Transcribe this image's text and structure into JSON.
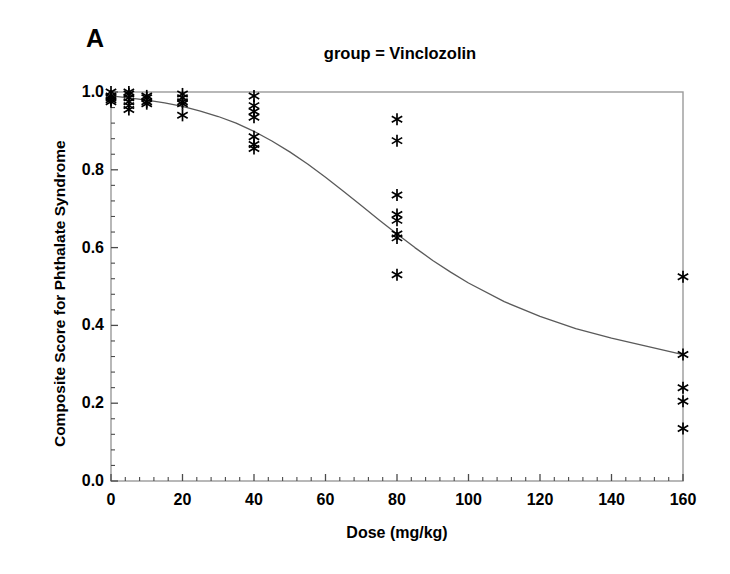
{
  "panel": {
    "label": "A"
  },
  "chart_data": {
    "type": "scatter",
    "title": "group = Vinclozolin",
    "subtitle": "",
    "xlabel": "Dose  (mg/kg)",
    "ylabel": "Composite Score for Phthalate Syndrome",
    "xlim": [
      0,
      160
    ],
    "ylim": [
      0.0,
      1.0
    ],
    "xticks": [
      0,
      20,
      40,
      60,
      80,
      100,
      120,
      140,
      160
    ],
    "xtick_labels": [
      "0",
      "20",
      "40",
      "60",
      "80",
      "100",
      "120",
      "140",
      "160"
    ],
    "yticks": [
      0.0,
      0.2,
      0.4,
      0.6,
      0.8,
      1.0
    ],
    "ytick_labels": [
      "0.0",
      "0.2",
      "0.4",
      "0.6",
      "0.8",
      "1.0"
    ],
    "minor_tick_count_x": 4,
    "minor_tick_count_y": 4,
    "grid": false,
    "legend": "none",
    "marker": "asterisk",
    "marker_color": "#000000",
    "frame_color": "#9a9a9a",
    "curve_color": "#5a5a5a",
    "points": [
      {
        "x": 0,
        "y": 1.0
      },
      {
        "x": 0,
        "y": 0.99
      },
      {
        "x": 0,
        "y": 0.985
      },
      {
        "x": 0,
        "y": 0.98
      },
      {
        "x": 0,
        "y": 0.975
      },
      {
        "x": 5,
        "y": 1.0
      },
      {
        "x": 5,
        "y": 0.995
      },
      {
        "x": 5,
        "y": 0.985
      },
      {
        "x": 5,
        "y": 0.975
      },
      {
        "x": 5,
        "y": 0.965
      },
      {
        "x": 5,
        "y": 0.955
      },
      {
        "x": 10,
        "y": 0.99
      },
      {
        "x": 10,
        "y": 0.985
      },
      {
        "x": 10,
        "y": 0.975
      },
      {
        "x": 10,
        "y": 0.97
      },
      {
        "x": 20,
        "y": 0.995
      },
      {
        "x": 20,
        "y": 0.985
      },
      {
        "x": 20,
        "y": 0.975
      },
      {
        "x": 20,
        "y": 0.97
      },
      {
        "x": 20,
        "y": 0.94
      },
      {
        "x": 40,
        "y": 0.99
      },
      {
        "x": 40,
        "y": 0.965
      },
      {
        "x": 40,
        "y": 0.95
      },
      {
        "x": 40,
        "y": 0.935
      },
      {
        "x": 40,
        "y": 0.885
      },
      {
        "x": 40,
        "y": 0.865
      },
      {
        "x": 40,
        "y": 0.855
      },
      {
        "x": 80,
        "y": 0.93
      },
      {
        "x": 80,
        "y": 0.875
      },
      {
        "x": 80,
        "y": 0.735
      },
      {
        "x": 80,
        "y": 0.685
      },
      {
        "x": 80,
        "y": 0.67
      },
      {
        "x": 80,
        "y": 0.635
      },
      {
        "x": 80,
        "y": 0.625
      },
      {
        "x": 80,
        "y": 0.53
      },
      {
        "x": 160,
        "y": 0.525
      },
      {
        "x": 160,
        "y": 0.325
      },
      {
        "x": 160,
        "y": 0.24
      },
      {
        "x": 160,
        "y": 0.205
      },
      {
        "x": 160,
        "y": 0.135
      }
    ],
    "fit_curve": {
      "name": "dose-response fit",
      "x": [
        0,
        5,
        10,
        15,
        20,
        25,
        30,
        35,
        40,
        45,
        50,
        55,
        60,
        65,
        70,
        75,
        80,
        85,
        90,
        95,
        100,
        110,
        120,
        130,
        140,
        150,
        160
      ],
      "y": [
        0.99,
        0.985,
        0.979,
        0.972,
        0.963,
        0.951,
        0.937,
        0.92,
        0.899,
        0.874,
        0.846,
        0.815,
        0.781,
        0.745,
        0.708,
        0.671,
        0.635,
        0.6,
        0.567,
        0.537,
        0.509,
        0.461,
        0.423,
        0.392,
        0.367,
        0.346,
        0.325
      ]
    }
  }
}
